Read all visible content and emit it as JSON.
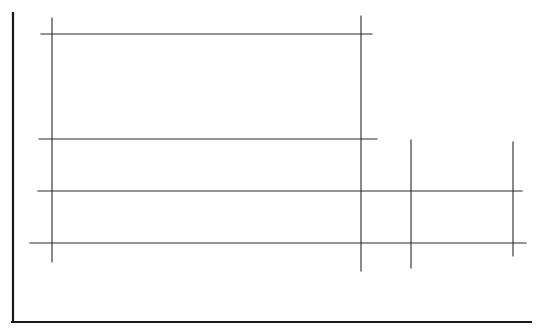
{
  "diagram": {
    "background": "#ffffff",
    "line_color": "#2a2a2a",
    "axis_color": "#1a1a1a",
    "axes": {
      "y_axis": {
        "x": 13,
        "y1": 13,
        "y2": 322,
        "width": 2.2
      },
      "x_axis": {
        "y": 322,
        "x1": 12,
        "x2": 531,
        "width": 2.2
      }
    },
    "horizontal_lines": [
      {
        "y": 34,
        "x1": 41,
        "x2": 372
      },
      {
        "y": 139,
        "x1": 39,
        "x2": 377
      },
      {
        "y": 191,
        "x1": 38,
        "x2": 522
      },
      {
        "y": 243,
        "x1": 30,
        "x2": 526
      }
    ],
    "vertical_lines": [
      {
        "x": 52,
        "y1": 18,
        "y2": 262
      },
      {
        "x": 361,
        "y1": 16,
        "y2": 271
      },
      {
        "x": 411,
        "y1": 140,
        "y2": 268
      },
      {
        "x": 513,
        "y1": 142,
        "y2": 256
      }
    ]
  }
}
